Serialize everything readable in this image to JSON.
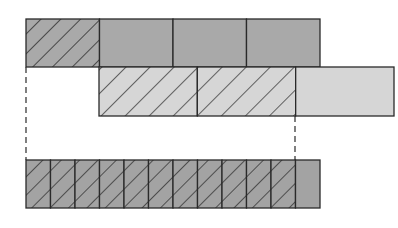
{
  "diagram": {
    "type": "fraction-bars",
    "colors": {
      "top_fill": "#a9a9a9",
      "middle_fill": "#d6d6d6",
      "bottom_fill": "#a3a3a3",
      "stroke": "#2a2a2a",
      "hatch": "#1e1e1e"
    },
    "bars": [
      {
        "name": "top-bar",
        "fraction": "1/4",
        "parts": 4,
        "hatched": 1,
        "x": 26,
        "y": 19,
        "width": 294,
        "height": 48
      },
      {
        "name": "middle-bar",
        "fraction": "2/3",
        "parts": 3,
        "hatched": 2,
        "x": 99,
        "y": 67,
        "width": 295,
        "height": 49
      },
      {
        "name": "bottom-bar",
        "fraction": "11/12",
        "parts": 12,
        "hatched": 11,
        "x": 26,
        "y": 160,
        "width": 294,
        "height": 48
      }
    ],
    "dashed_guides": [
      {
        "x": 26,
        "y1": 67,
        "y2": 160
      },
      {
        "x": 295,
        "y1": 116,
        "y2": 160
      }
    ]
  }
}
